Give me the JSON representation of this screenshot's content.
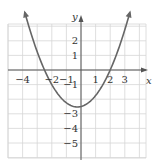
{
  "chart_data": {
    "type": "line",
    "title": "",
    "xlabel": "x",
    "ylabel": "y",
    "xlim": [
      -4.9,
      4.6
    ],
    "ylim": [
      -6,
      3.1
    ],
    "grid": true,
    "x_ticks": [
      "-4",
      "-2",
      "-1",
      "1",
      "2",
      "3"
    ],
    "y_ticks": [
      "2",
      "1",
      "-1",
      "-3",
      "-4",
      "-5"
    ],
    "series": [
      {
        "name": "parabola",
        "description": "upward-opening parabola with x-intercepts near -2.5 and 2, vertex near (-0.25, -2.5)",
        "x_intercepts": [
          -2.5,
          2
        ],
        "vertex": [
          -0.25,
          -2.53
        ],
        "x": [
          -3.9,
          -3.5,
          -3,
          -2.5,
          -2,
          -1.5,
          -1,
          -0.5,
          -0.25,
          0,
          0.5,
          1,
          1.5,
          2,
          2.5,
          3,
          3.4
        ],
        "values": [
          2.3,
          1.5,
          0.75,
          0,
          -0.75,
          -1.25,
          -1.75,
          -2.25,
          -2.5,
          -2.5,
          -2.25,
          -1.75,
          -1.0,
          0,
          0.75,
          1.5,
          2.3
        ]
      }
    ],
    "arrows_on_curve_ends": true,
    "arrows_on_axes": true
  },
  "labels": {
    "x_axis": "x",
    "y_axis": "y",
    "x_ticks": [
      {
        "text": "-4",
        "x": -4
      },
      {
        "text": "-2",
        "x": -2
      },
      {
        "text": "-1",
        "x": -1
      },
      {
        "text": "1",
        "x": 1
      },
      {
        "text": "2",
        "x": 2
      },
      {
        "text": "3",
        "x": 3
      }
    ],
    "y_ticks": [
      {
        "text": "2",
        "y": 2
      },
      {
        "text": "1",
        "y": 1
      },
      {
        "text": "-1",
        "y": -1
      },
      {
        "text": "-3",
        "y": -3
      },
      {
        "text": "-4",
        "y": -4
      },
      {
        "text": "-5",
        "y": -5
      }
    ]
  }
}
